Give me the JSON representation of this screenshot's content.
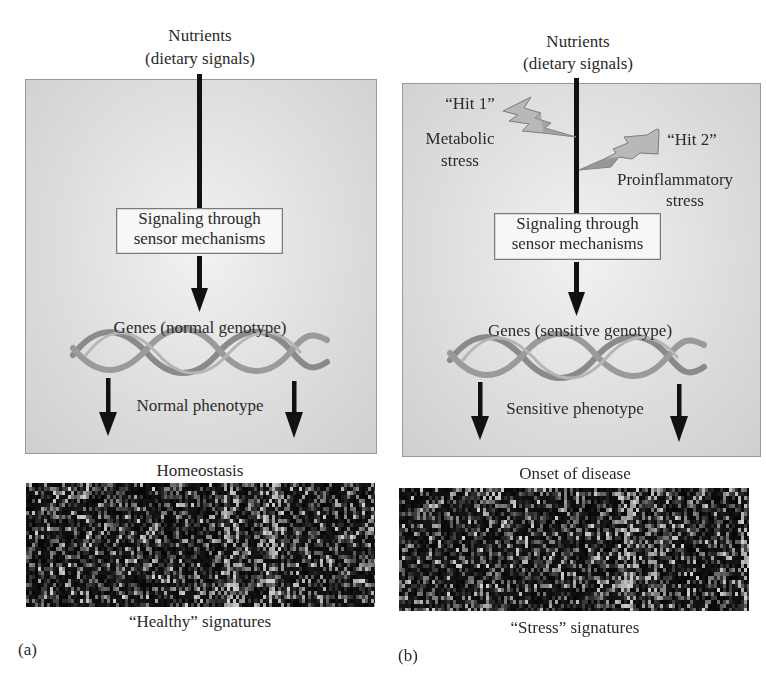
{
  "panels": {
    "a": {
      "label": "(a)",
      "input_title_line1": "Nutrients",
      "input_title_line2": "(dietary signals)",
      "sensor_line1": "Signaling through",
      "sensor_line2": "sensor mechanisms",
      "genes_label": "Genes (normal genotype)",
      "phenotype_label": "Normal phenotype",
      "outcome_label": "Homeostasis",
      "signature_label": "“Healthy” signatures"
    },
    "b": {
      "label": "(b)",
      "input_title_line1": "Nutrients",
      "input_title_line2": "(dietary signals)",
      "hit1_label": "“Hit 1”",
      "hit1_stress_line1": "Metabolic",
      "hit1_stress_line2": "stress",
      "hit2_label": "“Hit 2”",
      "hit2_stress_line1": "Proinflammatory",
      "hit2_stress_line2": "stress",
      "sensor_line1": "Signaling through",
      "sensor_line2": "sensor mechanisms",
      "genes_label": "Genes (sensitive genotype)",
      "phenotype_label": "Sensitive phenotype",
      "outcome_label": "Onset of disease",
      "signature_label": "“Stress” signatures"
    }
  },
  "icons": {
    "arrow": "down-arrow",
    "lightning": "lightning-bolt",
    "helix": "dna-double-helix",
    "heatmap": "gene-expression-heatmap"
  },
  "colors": {
    "panel_fill": "#dcdcdc",
    "arrow": "#111111",
    "helix": "#8c8c8c",
    "bolt": "#9a9a9a"
  }
}
